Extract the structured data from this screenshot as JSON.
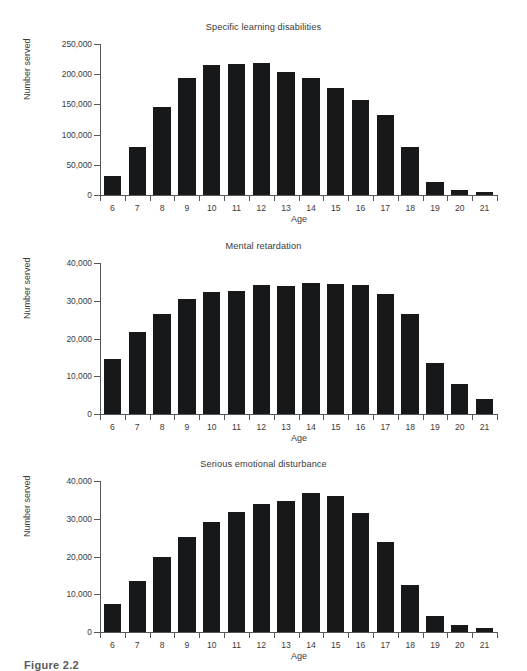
{
  "figure": {
    "caption": "Figure 2.2"
  },
  "charts": [
    {
      "id": "specific-learning-disabilities",
      "title": "Specific learning disabilities",
      "ylabel": "Number served",
      "xlabel": "Age",
      "ytick_labels": [
        "0",
        "50,000",
        "100,000",
        "150,000",
        "200,000",
        "250,000"
      ],
      "chart_data": {
        "type": "bar",
        "title": "Specific learning disabilities",
        "xlabel": "Age",
        "ylabel": "Number served",
        "categories": [
          "6",
          "7",
          "8",
          "9",
          "10",
          "11",
          "12",
          "13",
          "14",
          "15",
          "16",
          "17",
          "18",
          "19",
          "20",
          "21"
        ],
        "values": [
          32000,
          79000,
          145000,
          194000,
          215000,
          217000,
          218000,
          203000,
          193000,
          177000,
          158000,
          133000,
          80000,
          21000,
          8000,
          5000
        ],
        "ylim": [
          0,
          250000
        ],
        "ytick_values": [
          0,
          50000,
          100000,
          150000,
          200000,
          250000
        ],
        "grid": false,
        "legend": "none",
        "bar_color": "#17181a"
      }
    },
    {
      "id": "mental-retardation",
      "title": "Mental retardation",
      "ylabel": "Number served",
      "xlabel": "Age",
      "ytick_labels": [
        "0",
        "10,000",
        "20,000",
        "30,000",
        "40,000"
      ],
      "chart_data": {
        "type": "bar",
        "title": "Mental retardation",
        "xlabel": "Age",
        "ylabel": "Number served",
        "categories": [
          "6",
          "7",
          "8",
          "9",
          "10",
          "11",
          "12",
          "13",
          "14",
          "15",
          "16",
          "17",
          "18",
          "19",
          "20",
          "21"
        ],
        "values": [
          14500,
          21600,
          26500,
          30600,
          32300,
          32500,
          34100,
          33800,
          34600,
          34400,
          34200,
          31800,
          26600,
          13400,
          7900,
          4000
        ],
        "ylim": [
          0,
          40000
        ],
        "ytick_values": [
          0,
          10000,
          20000,
          30000,
          40000
        ],
        "grid": false,
        "legend": "none",
        "bar_color": "#17181a"
      }
    },
    {
      "id": "serious-emotional-disturbance",
      "title": "Serious emotional disturbance",
      "ylabel": "Number served",
      "xlabel": "Age",
      "ytick_labels": [
        "0",
        "10,000",
        "20,000",
        "30,000",
        "40,000"
      ],
      "chart_data": {
        "type": "bar",
        "title": "Serious emotional disturbance",
        "xlabel": "Age",
        "ylabel": "Number served",
        "categories": [
          "6",
          "7",
          "8",
          "9",
          "10",
          "11",
          "12",
          "13",
          "14",
          "15",
          "16",
          "17",
          "18",
          "19",
          "20",
          "21"
        ],
        "values": [
          7300,
          13600,
          19800,
          25300,
          29200,
          31800,
          33900,
          34600,
          36900,
          36100,
          31500,
          23900,
          12500,
          4200,
          1900,
          1100
        ],
        "ylim": [
          0,
          40000
        ],
        "ytick_values": [
          0,
          10000,
          20000,
          30000,
          40000
        ],
        "grid": false,
        "legend": "none",
        "bar_color": "#17181a"
      }
    }
  ]
}
